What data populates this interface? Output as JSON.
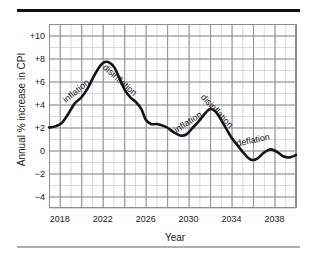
{
  "figure": {
    "background_color": "#ffffff",
    "rule_top_color": "#101010",
    "rule_bottom_color": "#aeaeae"
  },
  "chart_data": {
    "type": "line",
    "title": "",
    "xlabel": "Year",
    "ylabel": "Annual % increase in CPI",
    "xlim": [
      2017,
      2040
    ],
    "ylim": [
      -5,
      11
    ],
    "grid": true,
    "legend": "none",
    "line_color": "#141414",
    "grid_major_color": "#8d8d94",
    "grid_minor_color": "#c9c9d0",
    "xticks": [
      2018,
      2022,
      2026,
      2030,
      2034,
      2038
    ],
    "xtick_labels": [
      "2018",
      "2022",
      "2026",
      "2030",
      "2034",
      "2038"
    ],
    "yticks": [
      -4,
      -2,
      0,
      2,
      4,
      6,
      8,
      10
    ],
    "ytick_labels": [
      "−4",
      "−2",
      "0",
      "+2",
      "+4",
      "+6",
      "+8",
      "+10"
    ],
    "series": [
      {
        "name": "Annual % increase in CPI",
        "x": [
          2017,
          2017.6,
          2018.2,
          2018.8,
          2019.4,
          2020.0,
          2020.6,
          2021.2,
          2021.8,
          2022.2,
          2022.7,
          2023.1,
          2023.6,
          2024.1,
          2024.6,
          2025.1,
          2025.6,
          2026.0,
          2026.5,
          2027.0,
          2027.5,
          2028.0,
          2028.6,
          2029.2,
          2029.8,
          2030.4,
          2031.0,
          2031.6,
          2032.0,
          2032.5,
          2033.0,
          2033.5,
          2034.0,
          2034.6,
          2035.2,
          2035.8,
          2036.4,
          2037.0,
          2037.6,
          2038.2,
          2038.8,
          2039.4,
          2040.0
        ],
        "y": [
          2.0,
          2.1,
          2.4,
          3.2,
          4.1,
          4.6,
          5.4,
          6.5,
          7.4,
          7.7,
          7.6,
          7.2,
          6.2,
          5.2,
          4.6,
          4.2,
          3.6,
          2.7,
          2.3,
          2.3,
          2.2,
          2.0,
          1.6,
          1.3,
          1.4,
          2.0,
          2.6,
          3.3,
          3.6,
          3.4,
          2.7,
          1.9,
          1.1,
          0.4,
          -0.3,
          -0.8,
          -0.7,
          -0.2,
          0.1,
          -0.1,
          -0.5,
          -0.6,
          -0.4
        ]
      }
    ],
    "annotations": [
      {
        "text": "inflation",
        "x": 2019.5,
        "y": 5.2,
        "rotation": -40
      },
      {
        "text": "disinflation",
        "x": 2023.6,
        "y": 6.1,
        "rotation": 42
      },
      {
        "text": "inflation",
        "x": 2029.9,
        "y": 2.5,
        "rotation": -33
      },
      {
        "text": "disinflation",
        "x": 2032.6,
        "y": 3.4,
        "rotation": 47
      },
      {
        "text": "deflation",
        "x": 2036.0,
        "y": 0.9,
        "rotation": -12
      }
    ]
  }
}
